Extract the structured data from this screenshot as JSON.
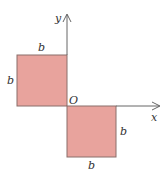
{
  "diagram": {
    "colors": {
      "fill": "#E8A39D",
      "stroke": "#8A6E6A",
      "axis": "#555555",
      "text": "#333333"
    },
    "axes": {
      "x_label": "x",
      "y_label": "y",
      "origin_label": "O"
    },
    "squares": [
      {
        "position": "upper-left",
        "top_label": "b",
        "side_label": "b"
      },
      {
        "position": "lower-right",
        "side_label": "b",
        "bottom_label": "b"
      }
    ]
  }
}
